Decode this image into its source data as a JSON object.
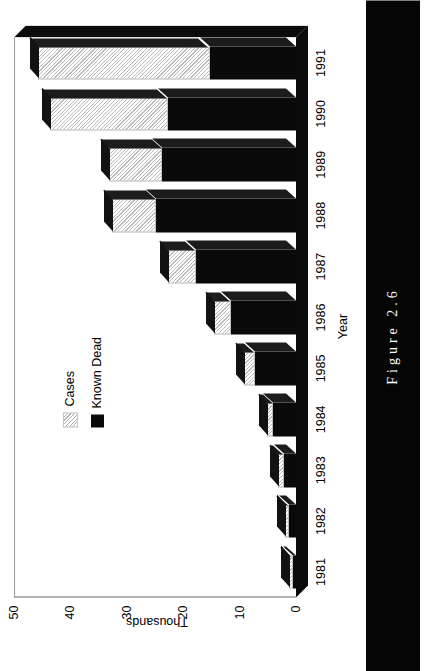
{
  "figure": {
    "caption": "Figure 2.6"
  },
  "chart_data": {
    "type": "bar",
    "title": "",
    "subtitle": "",
    "xlabel": "Year",
    "ylabel": "Thousands",
    "orientation": "vertical-stacked",
    "stacked": true,
    "grid": false,
    "legend_position": "upper-left",
    "categories": [
      "1981",
      "1982",
      "1983",
      "1984",
      "1985",
      "1986",
      "1987",
      "1988",
      "1989",
      "1990",
      "1991"
    ],
    "ylim": [
      0,
      50
    ],
    "yticks": [
      "0",
      "10",
      "20",
      "30",
      "40",
      "50"
    ],
    "ytick_values": [
      0,
      10,
      20,
      30,
      40,
      50
    ],
    "series": [
      {
        "name": "Known Dead",
        "fill": "solid-black",
        "color": "#0a0a0a",
        "values": [
          0.6,
          1.3,
          2.2,
          4.0,
          7.3,
          11.5,
          17.7,
          24.8,
          23.7,
          22.7,
          15.3
        ]
      },
      {
        "name": "Cases",
        "fill": "light-hatch",
        "color": "#e9e9e9",
        "values": [
          0.6,
          0.7,
          1.0,
          1.2,
          1.9,
          3.0,
          5.0,
          7.9,
          9.5,
          21.0,
          30.4
        ]
      }
    ],
    "totals": [
      1.2,
      2.0,
      3.2,
      5.2,
      9.2,
      14.5,
      22.7,
      32.7,
      33.2,
      43.7,
      45.7
    ],
    "legend": [
      "Cases",
      "Known Dead"
    ]
  }
}
